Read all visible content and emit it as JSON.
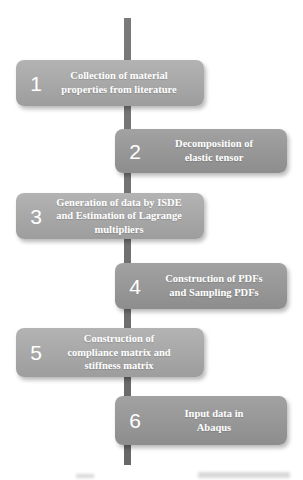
{
  "figure": {
    "type": "vertical-timeline-flowchart",
    "steps": [
      {
        "number": "1",
        "side": "left",
        "label": "Collection of material\nproperties from literature"
      },
      {
        "number": "2",
        "side": "right",
        "label": "Decomposition of\nelastic tensor"
      },
      {
        "number": "3",
        "side": "left",
        "label": "Generation of data by ISDE\nand Estimation of Lagrange\nmultipliers"
      },
      {
        "number": "4",
        "side": "right",
        "label": "Construction of PDFs\nand Sampling PDFs"
      },
      {
        "number": "5",
        "side": "left",
        "label": "Construction of\ncompliance matrix and\nstiffness matrix"
      },
      {
        "number": "6",
        "side": "right",
        "label": "Input data in\nAbaqus"
      }
    ],
    "colors": {
      "left_box": "#a8a8a8",
      "right_box": "#979797",
      "timeline_line": "#6f6f6f",
      "step_text": "#ffffff",
      "background": "#ffffff"
    }
  }
}
